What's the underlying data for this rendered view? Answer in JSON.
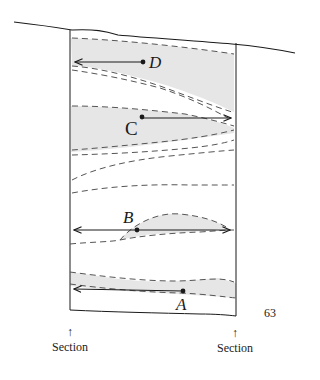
{
  "figure": {
    "points": [
      {
        "id": "D",
        "label": "D",
        "arrow_direction": "left"
      },
      {
        "id": "C",
        "label": "C",
        "arrow_direction": "right"
      },
      {
        "id": "B",
        "label": "B",
        "arrow_direction": "both"
      },
      {
        "id": "A",
        "label": "A",
        "arrow_direction": "left"
      }
    ],
    "section_markers": [
      {
        "arrow": "↑",
        "label": "Section"
      },
      {
        "arrow": "↑",
        "label": "Section"
      }
    ],
    "page_number": "63",
    "colors": {
      "ink": "#1a1a1a",
      "dashed_line": "#555555",
      "shading": "#e6e6e6"
    }
  }
}
